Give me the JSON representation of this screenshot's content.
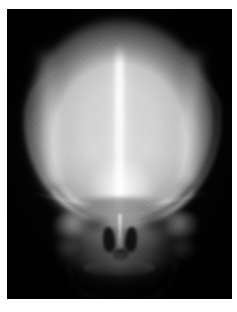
{
  "image": {
    "kind": "radiograph",
    "modality": "X-ray",
    "title": "Skull radiograph",
    "view": "anteroposterior (AP)",
    "subject": "human skull",
    "palette": "grayscale",
    "width_px": 237,
    "height_px": 312,
    "border": {
      "color": "#ffffff",
      "left_px": 7,
      "top_px": 9,
      "right_px": 5,
      "bottom_px": 13
    },
    "film": {
      "background_color": "#060606",
      "left_px": 7,
      "top_px": 9,
      "width_px": 225,
      "height_px": 290
    }
  },
  "tones": {
    "film_black": "#060606",
    "background_dark": "#0a0a0a",
    "vault_mid_gray": "#c2c2c2",
    "vault_bright_gray": "#d8d8d8",
    "brightest_white": "#f0f0f0",
    "face_gray": "#8c8c8c",
    "air_space_black": "#080808",
    "paper_white": "#ffffff"
  },
  "anatomy": {
    "cranial_vault": {
      "label": "cranial vault",
      "description": "large ovoid radiopaque dome occupying the upper two thirds of the film"
    },
    "sagittal_midline": {
      "label": "sagittal midline",
      "description": "bright vertical strip from vertex to glabella (sagittal suture / falx cerebri)"
    },
    "orbital_roof_arcs": {
      "label": "orbital roofs and sphenoid ridges",
      "description": "paired bright arcuate lines sweeping from the lateral vault down to the midline"
    },
    "glabella": {
      "label": "glabella / frontal sinus",
      "description": "bright confluent pool at the base of the midline"
    },
    "petrous_ridges": {
      "label": "petrous temporal bones",
      "description": "mottled dense patches lateral to the nasal cavity"
    },
    "nasal_cavity": {
      "label": "nasal cavity",
      "description": "paired dark radiolucent air spaces flanking the nasal septum"
    },
    "nasal_septum": {
      "label": "nasal septum",
      "description": "thin bright vertical line dividing the nasal air spaces"
    },
    "orbits": {
      "label": "orbits",
      "description": "faint dark crescents beneath the orbital roof arcs"
    },
    "maxilla": {
      "label": "maxilla and zygomatic arches",
      "description": "horizontal band of mid-gray bone below the nasal aperture"
    },
    "mandible": {
      "label": "mandible",
      "description": "bright U-shaped arch with alveolar tooth row at the lower border"
    },
    "scatter_halo": {
      "label": "scatter halo",
      "description": "soft grey penumbra of soft tissue surrounding the bony skull"
    },
    "film_grain": {
      "label": "film grain",
      "description": "fine quantum mottle texture across the whole exposure"
    },
    "emulsion_defect": {
      "label": "emulsion defect",
      "description": "small white speck on the left margin of the film"
    }
  }
}
